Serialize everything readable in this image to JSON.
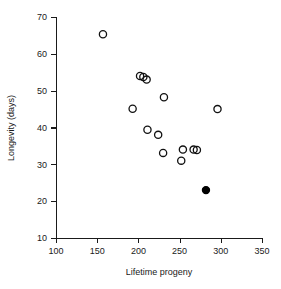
{
  "chart_data": {
    "type": "scatter",
    "title": "",
    "xlabel": "Lifetime progeny",
    "ylabel": "Longevity (days)",
    "xlim": [
      100,
      350
    ],
    "ylim": [
      10,
      70
    ],
    "xticks": [
      100,
      150,
      200,
      250,
      300,
      350
    ],
    "yticks": [
      10,
      20,
      30,
      40,
      50,
      60,
      70
    ],
    "grid": false,
    "legend": null,
    "series": [
      {
        "name": "open-circles",
        "marker": "open-circle",
        "color": "#111111",
        "points": [
          {
            "x": 157,
            "y": 65.3
          },
          {
            "x": 202,
            "y": 54.0
          },
          {
            "x": 206,
            "y": 53.7
          },
          {
            "x": 210,
            "y": 53.0
          },
          {
            "x": 231,
            "y": 48.2
          },
          {
            "x": 193,
            "y": 45.1
          },
          {
            "x": 296,
            "y": 45.0
          },
          {
            "x": 211,
            "y": 39.4
          },
          {
            "x": 224,
            "y": 38.0
          },
          {
            "x": 254,
            "y": 34.0
          },
          {
            "x": 267,
            "y": 34.0
          },
          {
            "x": 271,
            "y": 33.9
          },
          {
            "x": 230,
            "y": 33.1
          },
          {
            "x": 252,
            "y": 31.0
          }
        ]
      },
      {
        "name": "filled-circle",
        "marker": "filled-circle",
        "color": "#000000",
        "points": [
          {
            "x": 282,
            "y": 23.0
          }
        ]
      }
    ]
  },
  "figure": {
    "x_axis_label": "Lifetime progeny",
    "y_axis_label": "Longevity (days)",
    "x_tick_labels": [
      "100",
      "150",
      "200",
      "250",
      "300",
      "350"
    ],
    "y_tick_labels": [
      "10",
      "20",
      "30",
      "40",
      "50",
      "60",
      "70"
    ]
  }
}
